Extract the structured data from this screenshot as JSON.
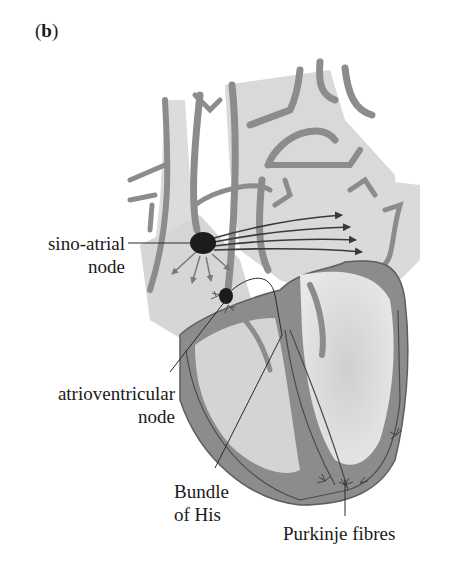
{
  "figure": {
    "panel_label": "b",
    "panel_label_open": "(",
    "panel_label_close": ")"
  },
  "labels": {
    "sa_node_line1": "sino-atrial",
    "sa_node_line2": "node",
    "av_node_line1": "atrioventricular",
    "av_node_line2": "node",
    "bundle_line1": "Bundle",
    "bundle_line2": "of His",
    "purkinje": "Purkinje fibres"
  },
  "colors": {
    "wall": "#8c8c8c",
    "wall_outline": "#5e5e5e",
    "chamber_fill": "#d6d6d6",
    "node": "#1c1c1c",
    "arrow": "#3a3a3a",
    "arrow_light": "#7a7a7a"
  }
}
